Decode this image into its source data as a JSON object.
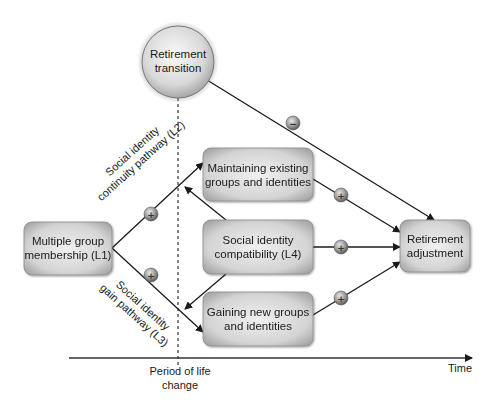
{
  "diagram": {
    "nodes": {
      "retirement_transition": [
        "Retirement",
        "transition"
      ],
      "l1": [
        "Multiple group",
        "membership (L1)"
      ],
      "l2_box": [
        "Maintaining existing",
        "groups and identities"
      ],
      "l4": [
        "Social identity",
        "compatibility (L4)"
      ],
      "l3_box": [
        "Gaining new groups",
        "and identities"
      ],
      "adjustment": [
        "Retirement",
        "adjustment"
      ]
    },
    "pathway_labels": {
      "continuity": [
        "Social identity",
        "continuity pathway (L2)"
      ],
      "gain": [
        "Social identity",
        "gain pathway (L3)"
      ]
    },
    "signs": {
      "l1_to_l2": "+",
      "l1_to_l3": "+",
      "l2_to_adjustment": "+",
      "l4_to_adjustment": "+",
      "l3_to_adjustment": "+",
      "transition_to_adjustment": "−"
    },
    "axis": {
      "period_label": [
        "Period of life",
        "change"
      ],
      "time_label": "Time"
    }
  }
}
